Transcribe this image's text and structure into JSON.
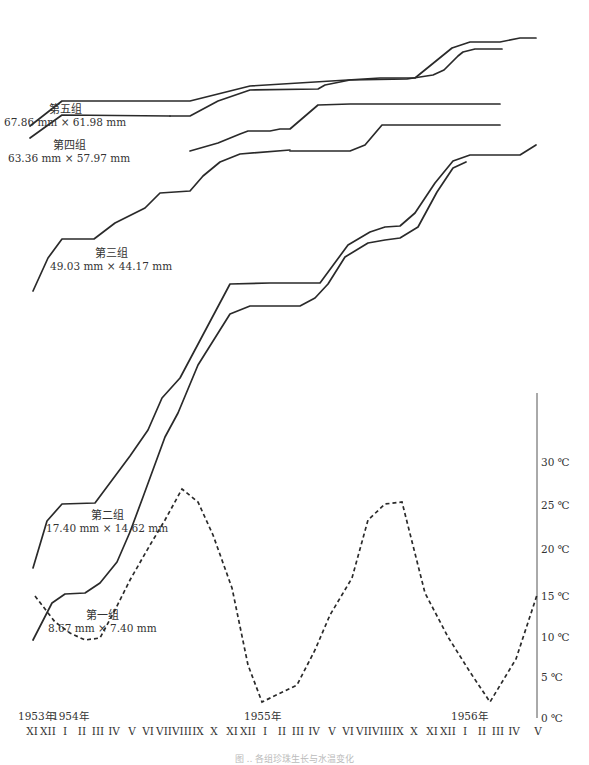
{
  "chart_data": {
    "type": "line",
    "title": "",
    "xlabel": "",
    "ylabel_right": "°C",
    "x_axis": {
      "year_labels": [
        {
          "label": "1953年",
          "x": 22
        },
        {
          "label": "1954年",
          "x": 56
        },
        {
          "label": "1955年",
          "x": 248
        },
        {
          "label": "1956年",
          "x": 455
        }
      ],
      "months": [
        {
          "label": "XI",
          "x": 32
        },
        {
          "label": "XII",
          "x": 48
        },
        {
          "label": "I",
          "x": 65
        },
        {
          "label": "II",
          "x": 82
        },
        {
          "label": "III",
          "x": 98
        },
        {
          "label": "IV",
          "x": 114
        },
        {
          "label": "V",
          "x": 132
        },
        {
          "label": "VI",
          "x": 148
        },
        {
          "label": "VII",
          "x": 164
        },
        {
          "label": "VIII",
          "x": 182
        },
        {
          "label": "IX",
          "x": 198
        },
        {
          "label": "X",
          "x": 214
        },
        {
          "label": "XI",
          "x": 232
        },
        {
          "label": "XII",
          "x": 248
        },
        {
          "label": "I",
          "x": 265
        },
        {
          "label": "II",
          "x": 282
        },
        {
          "label": "III",
          "x": 298
        },
        {
          "label": "IV",
          "x": 314
        },
        {
          "label": "V",
          "x": 332
        },
        {
          "label": "VI",
          "x": 348
        },
        {
          "label": "VII",
          "x": 364
        },
        {
          "label": "VIII",
          "x": 382
        },
        {
          "label": "IX",
          "x": 398
        },
        {
          "label": "X",
          "x": 414
        },
        {
          "label": "XI",
          "x": 432
        },
        {
          "label": "XII",
          "x": 448
        },
        {
          "label": "I",
          "x": 465
        },
        {
          "label": "II",
          "x": 482
        },
        {
          "label": "III",
          "x": 498
        },
        {
          "label": "IV",
          "x": 514
        },
        {
          "label": "V",
          "x": 538
        }
      ]
    },
    "y_axis_right": {
      "range": [
        0,
        35
      ],
      "ticks": [
        {
          "label": "0 ℃",
          "value": 0,
          "y": 718
        },
        {
          "label": "5 ℃",
          "value": 5,
          "y": 677
        },
        {
          "label": "10 ℃",
          "value": 10,
          "y": 637
        },
        {
          "label": "15 ℃",
          "value": 15,
          "y": 596
        },
        {
          "label": "20 ℃",
          "value": 20,
          "y": 549
        },
        {
          "label": "25 ℃",
          "value": 25,
          "y": 505
        },
        {
          "label": "30 ℃",
          "value": 30,
          "y": 462
        }
      ]
    },
    "series": [
      {
        "name": "第五组",
        "size": "67.86 mm × 61.98 mm",
        "style": "solid",
        "points": "30,126 62,101 190,101 250,86 380,78 415,78 452,48 470,42 500,42 520,38 536,38"
      },
      {
        "name": "第五组-2",
        "size": "",
        "style": "solid",
        "points": "170,116 190,116 218,101 250,90 318,89 325,85 350,80 407,79 433,75 444,70 458,56 463,52 475,49 502,49"
      },
      {
        "name": "第四组",
        "size": "63.36 mm × 57.97 mm",
        "style": "solid",
        "points": "30,138 62,115 170,116"
      },
      {
        "name": "第四组-2",
        "size": "",
        "style": "solid",
        "points": "190,151 218,143 240,134 248,131 270,131 280,129 290,129 318,105 350,104 450,104 455,104 500,104"
      },
      {
        "name": "第三组",
        "size": "49.03 mm × 44.17 mm",
        "style": "solid",
        "points": "33,291 48,258 62,239 94,239 115,223 145,208 160,193 190,191 203,176 220,162 240,154 290,150"
      },
      {
        "name": "第三组-2",
        "size": "",
        "style": "solid",
        "points": "290,151 318,151 350,151 365,145 382,125 450,125 485,125 500,125"
      },
      {
        "name": "第二组",
        "size": "17.40 mm × 14.62 mm",
        "style": "solid",
        "points": "33,568 47,521 62,504 95,503 130,456 148,430 162,398 180,378 230,284 270,283 320,283 348,245 370,232 385,227 400,226 415,213 435,183 453,161 470,155 520,155 536,145"
      },
      {
        "name": "第一组",
        "size": "8.67 mm × 7.40 mm",
        "style": "solid",
        "points": "33,640 52,603 65,594 85,593 100,583 117,562 130,532 143,497 165,437 178,413 198,365 230,314 250,306 300,306 315,298 328,284 345,257 368,243 385,240 400,238 418,227 437,192 453,168 466,162"
      },
      {
        "name": "月平均气温",
        "size": "",
        "style": "dashed",
        "points": "35,596 55,622 70,633 85,640 100,638 115,610 130,580 150,545 165,520 182,489 198,502 213,535 232,588 248,665 262,702 297,685 315,650 330,615 352,578 368,520 385,504 402,502 425,593 448,637 470,672 490,702 516,659 537,595"
      }
    ],
    "group_labels": [
      {
        "name": "第五组",
        "size": "67.86 mm × 61.98 mm",
        "x": 4,
        "y": 104
      },
      {
        "name": "第四组",
        "size": "63.36 mm × 57.97 mm",
        "x": 8,
        "y": 140
      },
      {
        "name": "第三组",
        "size": "49.03 mm × 44.17 mm",
        "x": 50,
        "y": 248
      },
      {
        "name": "第二组",
        "size": "17.40 mm × 14.62 mm",
        "x": 46,
        "y": 510
      },
      {
        "name": "第一组",
        "size": "8.67 mm × 7.40 mm",
        "x": 48,
        "y": 610
      }
    ],
    "temperature_axis": {
      "x": 537,
      "y_top": 393,
      "y_bottom": 718
    },
    "caption": "图 ‥ 各组珍珠生长与水温变化"
  }
}
